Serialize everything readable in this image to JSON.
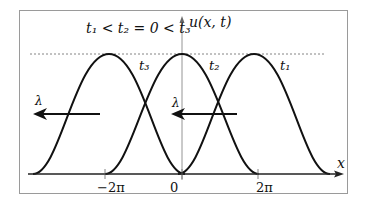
{
  "figure": {
    "title_relation": "t₁ < t₂ = 0 < t₃",
    "y_axis_label": "u(x, t)",
    "x_axis_label": "x",
    "tick_labels": [
      "−2π",
      "0",
      "2π"
    ],
    "curve_labels": [
      "t₃",
      "t₂",
      "t₁"
    ],
    "arrow_labels": [
      "λ",
      "λ"
    ],
    "colors": {
      "curve": "#111111",
      "frame": "#9a9a9a",
      "dotted": "#666666"
    }
  },
  "curves": [
    {
      "label": "t3",
      "center": "-2π",
      "half_width": "2π"
    },
    {
      "label": "t2",
      "center": "0",
      "half_width": "2π"
    },
    {
      "label": "t1",
      "center": "2π",
      "half_width": "2π"
    }
  ]
}
